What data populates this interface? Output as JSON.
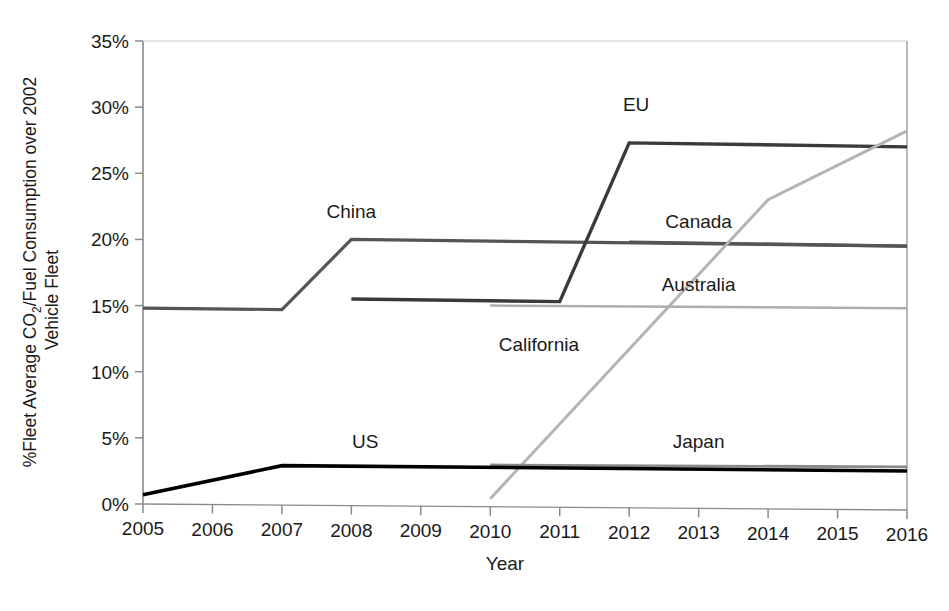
{
  "chart_data": {
    "type": "line",
    "title": "",
    "xlabel": "Year",
    "ylabel_line1_pre": "%Fleet Average CO",
    "ylabel_line1_sub": "2",
    "ylabel_line1_post": "/Fuel Consumption over 2002",
    "ylabel_line2": "Vehicle Fleet",
    "ylabel_full": "%Fleet Average CO2/Fuel Consumption over 2002 Vehicle Fleet",
    "xlim": [
      2005,
      2016
    ],
    "ylim": [
      0,
      35
    ],
    "grid": false,
    "legend_position": "inline-labels",
    "x_ticks": [
      "2005",
      "2006",
      "2007",
      "2008",
      "2009",
      "2010",
      "2011",
      "2012",
      "2013",
      "2014",
      "2015",
      "2016"
    ],
    "x_tick_values": [
      2005,
      2006,
      2007,
      2008,
      2009,
      2010,
      2011,
      2012,
      2013,
      2014,
      2015,
      2016
    ],
    "y_ticks": [
      "0%",
      "5%",
      "10%",
      "15%",
      "20%",
      "25%",
      "30%",
      "35%"
    ],
    "y_tick_values": [
      0,
      5,
      10,
      15,
      20,
      25,
      30,
      35
    ],
    "series": [
      {
        "name": "China",
        "label": "China",
        "color": "#555555",
        "width": 3.2,
        "label_x": 2008.0,
        "label_y": 21.6,
        "x": [
          2005,
          2007,
          2008,
          2016
        ],
        "values": [
          14.8,
          14.7,
          20.0,
          19.5
        ]
      },
      {
        "name": "EU",
        "label": "EU",
        "color": "#3a3a3a",
        "width": 3.4,
        "label_x": 2012.1,
        "label_y": 29.7,
        "x": [
          2008,
          2011,
          2012,
          2016
        ],
        "values": [
          15.5,
          15.3,
          27.3,
          27.0
        ]
      },
      {
        "name": "Canada",
        "label": "Canada",
        "color": "#555555",
        "width": 3.2,
        "label_x": 2013.0,
        "label_y": 20.9,
        "x": [
          2012,
          2016
        ],
        "values": [
          19.8,
          19.5
        ]
      },
      {
        "name": "California",
        "label": "California",
        "color": "#b4b4b4",
        "width": 3.0,
        "label_x": 2010.7,
        "label_y": 11.6,
        "x": [
          2010,
          2014,
          2016
        ],
        "values": [
          0.4,
          23.0,
          28.2
        ]
      },
      {
        "name": "Australia",
        "label": "Australia",
        "color": "#adadad",
        "width": 2.6,
        "label_x": 2013.0,
        "label_y": 16.1,
        "x": [
          2010,
          2016
        ],
        "values": [
          15.0,
          14.8
        ]
      },
      {
        "name": "Japan",
        "label": "Japan",
        "color": "#8a8a8a",
        "width": 2.8,
        "label_x": 2013.0,
        "label_y": 4.2,
        "x": [
          2010,
          2016
        ],
        "values": [
          2.95,
          2.8
        ]
      },
      {
        "name": "US",
        "label": "US",
        "color": "#000000",
        "width": 3.6,
        "label_x": 2008.2,
        "label_y": 4.2,
        "x": [
          2005,
          2007,
          2016
        ],
        "values": [
          0.7,
          2.9,
          2.5
        ]
      }
    ]
  },
  "axes": {
    "axis_color": "#8a8a8a",
    "tick_color": "#8a8a8a"
  }
}
